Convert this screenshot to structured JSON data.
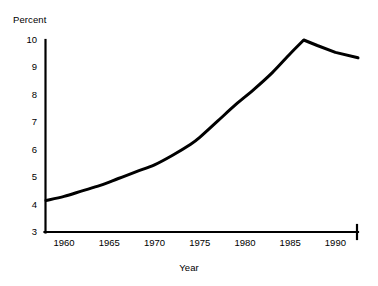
{
  "chart_data": {
    "type": "line",
    "title": "",
    "xlabel": "Year",
    "ylabel": "Percent",
    "xlim": [
      1958,
      1992.5
    ],
    "ylim": [
      3,
      10.3
    ],
    "grid": false,
    "legend": "none",
    "line_color": "#000000",
    "axis_color": "#000000",
    "x_tick_labels": [
      "1960",
      "1965",
      "1970",
      "1975",
      "1980",
      "1985",
      "1990"
    ],
    "x_ticks": [
      1960,
      1965,
      1970,
      1975,
      1980,
      1985,
      1990
    ],
    "y_tick_labels": [
      "3",
      "4",
      "5",
      "6",
      "7",
      "8",
      "9",
      "10"
    ],
    "y_ticks": [
      3,
      4,
      5,
      6,
      7,
      8,
      9,
      10
    ],
    "series": [
      {
        "name": "Percent",
        "x": [
          1958,
          1960,
          1962,
          1964,
          1966,
          1968,
          1970,
          1972,
          1974,
          1975,
          1977,
          1979,
          1981,
          1983,
          1985,
          1986.5,
          1988,
          1990,
          1992.5
        ],
        "values": [
          4.15,
          4.3,
          4.5,
          4.7,
          4.95,
          5.2,
          5.45,
          5.8,
          6.2,
          6.45,
          7.05,
          7.65,
          8.2,
          8.8,
          9.5,
          10.0,
          9.8,
          9.55,
          9.35
        ]
      }
    ]
  }
}
